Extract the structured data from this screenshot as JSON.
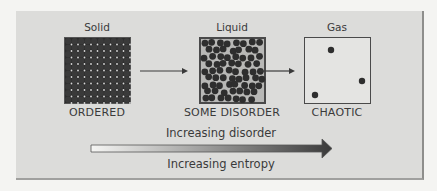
{
  "states": [
    {
      "name": "Solid",
      "caption": "ORDERED",
      "arrangement": "regular-lattice"
    },
    {
      "name": "Liquid",
      "caption": "SOME DISORDER",
      "arrangement": "random-packed"
    },
    {
      "name": "Gas",
      "caption": "CHAOTIC",
      "arrangement": "sparse",
      "particle_count": 3
    }
  ],
  "flow_arrows": [
    "solid-to-liquid",
    "liquid-to-gas"
  ],
  "gradient_arrow": {
    "label_above": "Increasing disorder",
    "label_below": "Increasing entropy"
  },
  "colors": {
    "panel": "#dcdcda",
    "particle": "#2e2e2e",
    "arrow_start": "#f6f6f4",
    "arrow_end": "#3a3a3a"
  }
}
